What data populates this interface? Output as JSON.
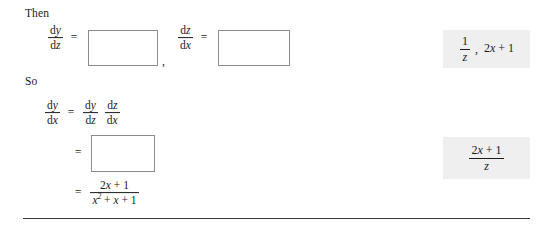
{
  "document": {
    "type": "math-worked-example",
    "topic": "chain-rule-differentiation"
  },
  "labels": {
    "then": "Then",
    "so": "So"
  },
  "symbols": {
    "d": "d",
    "x": "x",
    "y": "y",
    "z": "z",
    "equals": "=",
    "comma": ",",
    "plus": "+",
    "one": "1",
    "two": "2",
    "squared": "2"
  },
  "line_then": {
    "expr1": {
      "lhs_num": "dy",
      "lhs_den": "dz",
      "equals": "=",
      "input_value": ""
    },
    "separator": ",",
    "expr2": {
      "lhs_num": "dz",
      "lhs_den": "dx",
      "equals": "=",
      "input_value": ""
    }
  },
  "line_so": {
    "chain_rule": {
      "lhs_num": "dy",
      "lhs_den": "dx",
      "equals": "=",
      "rhs_first_num": "dy",
      "rhs_first_den": "dz",
      "rhs_second_num": "dz",
      "rhs_second_den": "dx"
    },
    "step_input": {
      "equals": "=",
      "input_value": ""
    },
    "final_result": {
      "equals": "=",
      "numerator": "2x + 1",
      "denominator": "x2 + x + 1"
    }
  },
  "answers": [
    {
      "id": "answer-then",
      "text": "1/z, 2x + 1",
      "parts": {
        "frac_num": "1",
        "frac_den": "z",
        "comma": ",",
        "tail": "2x + 1"
      }
    },
    {
      "id": "answer-so",
      "text": "(2x + 1)/z",
      "parts": {
        "frac_num": "2x + 1",
        "frac_den": "z"
      }
    }
  ],
  "colors": {
    "text": "#1b1b1b",
    "answer_panel_background": "#efefef",
    "input_border": "#8b8b8b",
    "rule": "#3a3a3a",
    "page_background": "#ffffff"
  }
}
